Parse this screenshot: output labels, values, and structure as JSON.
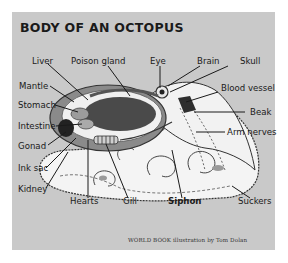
{
  "title": "BODY OF AN OCTOPUS",
  "labels": {
    "liver": "Liver",
    "poison_gland": "Poison gland",
    "eye": "Eye",
    "brain": "Brain",
    "skull": "Skull",
    "mantle": "Mantle",
    "blood_vessel": "Blood vessel",
    "stomach": "Stomach",
    "beak": "Beak",
    "intestine": "Intestine",
    "arm_nerves": "Arm nerves",
    "gonad": "Gonad",
    "ink_sac": "Ink sac",
    "kidney": "Kidney",
    "hearts": "Hearts",
    "gill": "Gill",
    "siphon": "Siphon",
    "suckers": "Suckers"
  },
  "credit": "WORLD BOOK illustration by Tom Dolan",
  "colors": {
    "background": "#c9c9c9",
    "body_light": "#f4f4f4",
    "organ_dark": "#4a4a4a",
    "organ_mid": "#8a8a8a",
    "text": "#1a1a1a"
  }
}
